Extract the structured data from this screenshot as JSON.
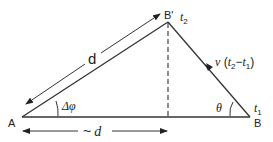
{
  "diagram": {
    "points": {
      "A": {
        "label": "A"
      },
      "B": {
        "label": "B"
      },
      "B_prime": {
        "label": "B'"
      }
    },
    "times": {
      "t1": {
        "base": "t",
        "sub": "1"
      },
      "t2": {
        "base": "t",
        "sub": "2"
      }
    },
    "labels": {
      "top_distance": "d",
      "bottom_distance_prefix": "~",
      "bottom_distance_var": "d",
      "delta_phi": "Δφ",
      "theta": "θ",
      "velocity_v": "v",
      "velocity_open": " (",
      "velocity_t2": "t",
      "velocity_t2_sub": "2",
      "velocity_minus": "−",
      "velocity_t1": "t",
      "velocity_t1_sub": "1",
      "velocity_close": ")"
    },
    "colors": {
      "line": "#222222",
      "dashed": "#222222",
      "background": "#ffffff"
    }
  }
}
